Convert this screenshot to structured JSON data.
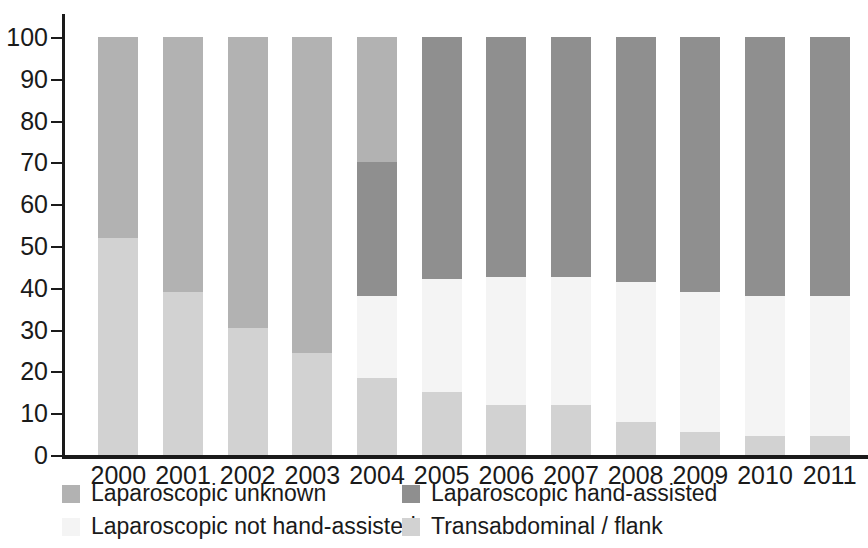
{
  "chart_data": {
    "type": "bar",
    "subtype": "stacked-100-percent",
    "title": "",
    "subtitle": "",
    "xlabel": "",
    "ylabel": "",
    "categories": [
      "2000",
      "2001",
      "2002",
      "2003",
      "2004",
      "2005",
      "2006",
      "2007",
      "2008",
      "2009",
      "2010",
      "2011"
    ],
    "ylim": [
      0,
      100
    ],
    "y_ticks": [
      0,
      10,
      20,
      30,
      40,
      50,
      60,
      70,
      80,
      90,
      100
    ],
    "y_tick_labels": [
      "0",
      "10",
      "20",
      "30",
      "40",
      "50",
      "60",
      "70",
      "80",
      "90",
      "100"
    ],
    "grid": false,
    "legend_position": "bottom",
    "stack_order_bottom_to_top": [
      "Transabdominal / flank",
      "Laparoscopic not hand-assisted",
      "Laparoscopic hand-assisted",
      "Laparoscopic unknown"
    ],
    "series": [
      {
        "name": "Transabdominal / flank",
        "color": "#d2d2d2",
        "values": [
          52,
          39,
          30.5,
          24.5,
          18.5,
          15,
          12,
          12,
          8,
          5.5,
          4.5,
          4.5
        ]
      },
      {
        "name": "Laparoscopic not hand-assisted",
        "color": "#f4f4f4",
        "values": [
          0,
          0,
          0,
          0,
          19.5,
          27,
          30.5,
          30.5,
          33.5,
          33.5,
          33.5,
          33.5
        ]
      },
      {
        "name": "Laparoscopic hand-assisted",
        "color": "#8f8f8f",
        "values": [
          0,
          0,
          0,
          0,
          32,
          58,
          57.5,
          57.5,
          58.5,
          61,
          62,
          62
        ]
      },
      {
        "name": "Laparoscopic unknown",
        "color": "#b2b2b2",
        "values": [
          48,
          61,
          69.5,
          75.5,
          30,
          0,
          0,
          0,
          0,
          0,
          0,
          0
        ]
      }
    ]
  },
  "legend": {
    "items": [
      {
        "label": "Laparoscopic unknown",
        "color": "#b2b2b2",
        "swatch_name": "legend-swatch-laparoscopic-unknown"
      },
      {
        "label": "Laparoscopic not hand-assisted",
        "color": "#f4f4f4",
        "swatch_name": "legend-swatch-laparoscopic-not-hand-assisted"
      },
      {
        "label": "Laparoscopic hand-assisted",
        "color": "#8f8f8f",
        "swatch_name": "legend-swatch-laparoscopic-hand-assisted"
      },
      {
        "label": "Transabdominal / flank",
        "color": "#d2d2d2",
        "swatch_name": "legend-swatch-transabdominal-flank"
      }
    ]
  },
  "colors": {
    "axis": "#1a1a1a",
    "background": "#ffffff",
    "laparoscopic_unknown": "#b2b2b2",
    "laparoscopic_hand_assisted": "#8f8f8f",
    "laparoscopic_not_hand_assisted": "#f4f4f4",
    "transabdominal_flank": "#d2d2d2"
  }
}
